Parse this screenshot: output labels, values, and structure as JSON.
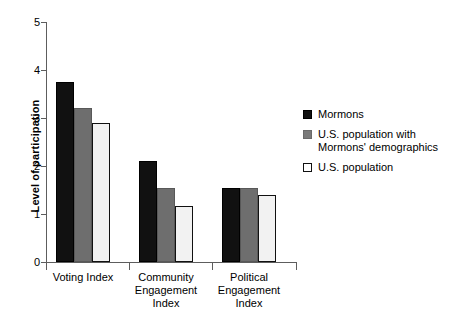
{
  "chart_data": {
    "type": "bar",
    "title": "",
    "subtitle": "",
    "xlabel": "",
    "ylabel": "Level of participation",
    "ylim": [
      0,
      5
    ],
    "ytick_labels": [
      "0",
      "1",
      "2",
      "3",
      "4",
      "5"
    ],
    "ytick_values": [
      0,
      1,
      2,
      3,
      4,
      5
    ],
    "grid": false,
    "legend_position": "right",
    "categories": [
      "Voting Index",
      "Community Engagement Index",
      "Political Engagement Index"
    ],
    "category_label_lines": [
      [
        "Voting Index"
      ],
      [
        "Community",
        "Engagement",
        "Index"
      ],
      [
        "Political",
        "Engagement",
        "Index"
      ]
    ],
    "series": [
      {
        "name": "Mormons",
        "legend_label": "Mormons",
        "color": "#111111",
        "values": [
          3.75,
          2.1,
          1.55
        ]
      },
      {
        "name": "U.S. population with Mormons' demographics",
        "legend_label": "U.S. population with\nMormons' demographics",
        "color": "#6e6e6e",
        "values": [
          3.2,
          1.55,
          1.55
        ]
      },
      {
        "name": "U.S. population",
        "legend_label": "U.S. population",
        "color": "#f2f2f2",
        "values": [
          2.9,
          1.17,
          1.4
        ]
      }
    ]
  },
  "axis": {
    "y_title": "Level of participation"
  }
}
